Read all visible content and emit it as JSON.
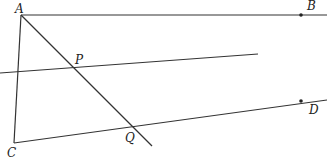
{
  "diagram": {
    "type": "geometry",
    "labels": {
      "A": "A",
      "B": "B",
      "C": "C",
      "D": "D",
      "P": "P",
      "Q": "Q"
    },
    "points": {
      "A": [
        21,
        15
      ],
      "B": [
        301,
        15
      ],
      "C": [
        14,
        143
      ],
      "D": [
        301,
        101
      ],
      "P": [
        73,
        68
      ],
      "Q": [
        131,
        126
      ]
    },
    "lines": [
      {
        "name": "ray-AB",
        "from": [
          21,
          15
        ],
        "to": [
          327,
          15
        ]
      },
      {
        "name": "segment-AC",
        "from": [
          21,
          15
        ],
        "to": [
          14,
          143
        ]
      },
      {
        "name": "line-AQ",
        "from": [
          21,
          15
        ],
        "to": [
          152,
          146
        ]
      },
      {
        "name": "transversal-P",
        "from": [
          0,
          73
        ],
        "to": [
          258,
          54
        ]
      },
      {
        "name": "ray-CD",
        "from": [
          14,
          143
        ],
        "to": [
          327,
          100
        ]
      }
    ],
    "colors": {
      "stroke": "#333333",
      "text": "#222222",
      "background": "#ffffff"
    }
  }
}
